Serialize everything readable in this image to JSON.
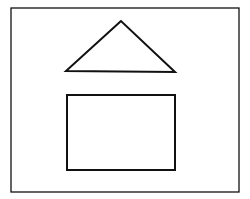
{
  "diagram": {
    "background": "#ffffff",
    "stroke_color": "#111111",
    "frame": {
      "x": 11,
      "y": 8,
      "width": 228,
      "height": 184,
      "stroke_width": 1.3
    },
    "triangle": {
      "points": "121,21 66,71 175,72",
      "stroke_width": 2
    },
    "rectangle": {
      "x": 67,
      "y": 95,
      "width": 108,
      "height": 75,
      "stroke_width": 2
    }
  }
}
